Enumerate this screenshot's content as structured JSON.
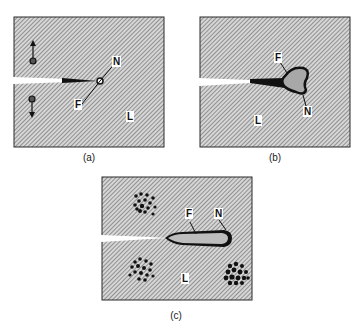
{
  "figure": {
    "panels": [
      {
        "id": "a",
        "caption": "(a)",
        "labels": {
          "notch": "N",
          "fracture": "F",
          "lattice": "L"
        },
        "features": [
          "dislocation-pair-with-arrows",
          "sharp-crack-tip",
          "small-void-at-tip"
        ]
      },
      {
        "id": "b",
        "caption": "(b)",
        "labels": {
          "fracture": "F",
          "notch": "N",
          "lattice": "L"
        },
        "features": [
          "crack",
          "blunted-damage-zone-at-tip"
        ]
      },
      {
        "id": "c",
        "caption": "(c)",
        "labels": {
          "fracture": "F",
          "notch": "N",
          "lattice": "L"
        },
        "features": [
          "crack",
          "elongated-blunted-tip",
          "dislocation-clusters"
        ]
      }
    ],
    "colors": {
      "hatch_light": "#d8d8d8",
      "hatch_dark": "#6a6a6a",
      "border": "#2a2a2a",
      "crack_dark": "#111111",
      "zone_fill": "#a8a8a8"
    }
  }
}
